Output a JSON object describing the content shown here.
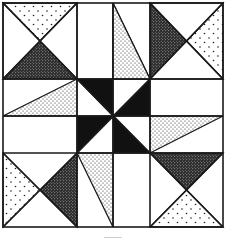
{
  "fills": {
    "white": "#ffffff",
    "light_dots": "light-dots",
    "medium_dots": "medium-dots",
    "dense_dots": "dense-dots",
    "black": "#111111"
  },
  "grid": {
    "columns": 4,
    "rows": 4,
    "description": "Outer corner squares are large, middle bands narrow; center pinwheel of four black triangles"
  },
  "patches": [
    {
      "name": "top-left-top-triangle",
      "fill": "light_dots"
    },
    {
      "name": "top-left-bottom-triangle",
      "fill": "dense_dots"
    },
    {
      "name": "top-left-left-triangle",
      "fill": "white"
    },
    {
      "name": "top-left-right-triangle",
      "fill": "white"
    },
    {
      "name": "top-mid-left-long-triangle",
      "fill": "white"
    },
    {
      "name": "top-mid-right-long-triangle",
      "fill": "medium_dots"
    },
    {
      "name": "top-right-left-triangle",
      "fill": "dense_dots"
    },
    {
      "name": "top-right-right-triangle",
      "fill": "light_dots"
    },
    {
      "name": "top-right-top-triangle",
      "fill": "white"
    },
    {
      "name": "top-right-bottom-triangle",
      "fill": "white"
    },
    {
      "name": "mid-left-upper-long-triangle",
      "fill": "medium_dots"
    },
    {
      "name": "mid-right-lower-long-triangle",
      "fill": "medium_dots"
    },
    {
      "name": "center-pinwheel-blade-1",
      "fill": "black"
    },
    {
      "name": "center-pinwheel-blade-2",
      "fill": "black"
    },
    {
      "name": "center-pinwheel-blade-3",
      "fill": "black"
    },
    {
      "name": "center-pinwheel-blade-4",
      "fill": "black"
    },
    {
      "name": "bottom-left-left-triangle",
      "fill": "light_dots"
    },
    {
      "name": "bottom-left-right-triangle",
      "fill": "dense_dots"
    },
    {
      "name": "bottom-mid-left-long-triangle",
      "fill": "medium_dots"
    },
    {
      "name": "bottom-right-top-triangle",
      "fill": "dense_dots"
    },
    {
      "name": "bottom-right-bottom-triangle",
      "fill": "light_dots"
    }
  ]
}
